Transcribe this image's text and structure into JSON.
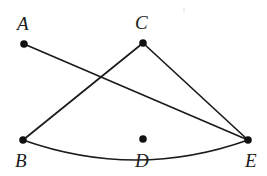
{
  "figure": {
    "kind": "geometry-diagram",
    "width": 267,
    "height": 176,
    "background_color": "#ffffff",
    "stroke_color": "#1b1b1b",
    "dot_color": "#111111",
    "dot_radius": 3.6,
    "stroke_width": 1.6,
    "points": [
      {
        "id": "A",
        "label": "A",
        "x": 24,
        "y": 44,
        "label_x": 17,
        "label_y": 14,
        "has_dot": true
      },
      {
        "id": "C",
        "label": "C",
        "x": 143,
        "y": 43,
        "label_x": 135,
        "label_y": 13,
        "has_dot": true
      },
      {
        "id": "B",
        "label": "B",
        "x": 23,
        "y": 140,
        "label_x": 15,
        "label_y": 151,
        "has_dot": true
      },
      {
        "id": "D",
        "label": "D",
        "x": 143,
        "y": 139,
        "label_x": 135,
        "label_y": 151,
        "has_dot": true
      },
      {
        "id": "E",
        "label": "E",
        "x": 248,
        "y": 140,
        "label_x": 245,
        "label_y": 151,
        "has_dot": true
      }
    ],
    "segments": [
      {
        "id": "AE",
        "from": "A",
        "to": "E",
        "x1": 24,
        "y1": 44,
        "x2": 248,
        "y2": 140
      },
      {
        "id": "CB",
        "from": "C",
        "to": "B",
        "x1": 143,
        "y1": 43,
        "x2": 23,
        "y2": 140
      },
      {
        "id": "CE",
        "from": "C",
        "to": "E",
        "x1": 143,
        "y1": 43,
        "x2": 248,
        "y2": 140
      }
    ],
    "arcs": [
      {
        "id": "BE",
        "from": "B",
        "to": "E",
        "bulge": "downward",
        "path": "M 23 140 Q 136 180 248 140"
      }
    ],
    "artifact": {
      "id": "scan-speck",
      "x": 183,
      "y": 8
    }
  }
}
